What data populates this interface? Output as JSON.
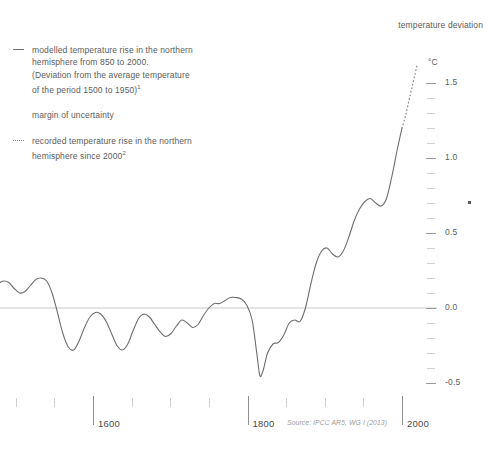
{
  "legend": {
    "entries": [
      {
        "marker": "solid-line",
        "text": "modelled temperature rise in the northern\nhemisphere from 850 to 2000.\n(Deviation from the average temperature\nof the period 1500 to 1950)",
        "footnote": "1",
        "footnote_after_line": 2
      },
      {
        "marker": "none",
        "text": "margin of uncertainty",
        "footnote": ""
      },
      {
        "marker": "dotted-line",
        "text": "recorded temperature rise in the northern\nhemisphere since 2000",
        "footnote": "2"
      }
    ]
  },
  "axis_title": "temperature\ndeviation",
  "unit": "°C",
  "source": "Source: IPCC AR5, WG I (2013)",
  "chart_data": {
    "type": "line",
    "title": "temperature deviation",
    "xlabel": "",
    "ylabel": "°C",
    "xlim": [
      1400,
      2025
    ],
    "ylim": [
      -0.62,
      1.72
    ],
    "grid": false,
    "legend_position": "top-left",
    "zero_line": 0.0,
    "y_major_ticks": [
      -0.5,
      0.0,
      0.5,
      1.0,
      1.5
    ],
    "y_major_tick_labels": [
      "-0.5",
      "0.0",
      "0.5",
      "1.0",
      "1.5"
    ],
    "y_minor_tick_step": 0.1,
    "x_major_ticks": [
      1600,
      1800,
      2000
    ],
    "x_major_tick_labels": [
      "1600",
      "1800",
      "2000"
    ],
    "x_minor_tick_step": 50,
    "series": [
      {
        "name": "modelled temperature rise in the northern hemisphere from 850 to 2000",
        "style": "solid",
        "color": "#6e6e6e",
        "x": [
          1400,
          1407,
          1414,
          1421,
          1428,
          1435,
          1442,
          1449,
          1456,
          1463,
          1470,
          1477,
          1484,
          1491,
          1498,
          1505,
          1512,
          1519,
          1526,
          1533,
          1540,
          1547,
          1554,
          1561,
          1568,
          1575,
          1582,
          1589,
          1596,
          1603,
          1610,
          1617,
          1624,
          1631,
          1638,
          1645,
          1652,
          1659,
          1666,
          1673,
          1680,
          1687,
          1694,
          1701,
          1708,
          1715,
          1722,
          1729,
          1736,
          1743,
          1750,
          1757,
          1764,
          1771,
          1778,
          1785,
          1792,
          1799,
          1806,
          1812,
          1816,
          1820,
          1826,
          1833,
          1840,
          1847,
          1854,
          1861,
          1868,
          1875,
          1882,
          1889,
          1896,
          1903,
          1910,
          1917,
          1924,
          1931,
          1938,
          1945,
          1952,
          1959,
          1966,
          1973,
          1980,
          1987,
          1994,
          2000
        ],
        "y": [
          0.06,
          0.05,
          0.04,
          0.07,
          0.12,
          0.16,
          0.17,
          0.14,
          0.1,
          0.09,
          0.12,
          0.16,
          0.18,
          0.17,
          0.13,
          0.1,
          0.11,
          0.15,
          0.19,
          0.2,
          0.18,
          0.1,
          -0.03,
          -0.17,
          -0.26,
          -0.28,
          -0.22,
          -0.13,
          -0.06,
          -0.03,
          -0.04,
          -0.09,
          -0.17,
          -0.25,
          -0.28,
          -0.24,
          -0.15,
          -0.07,
          -0.04,
          -0.06,
          -0.11,
          -0.16,
          -0.19,
          -0.17,
          -0.12,
          -0.08,
          -0.1,
          -0.13,
          -0.11,
          -0.05,
          0.0,
          0.03,
          0.03,
          0.05,
          0.07,
          0.07,
          0.06,
          0.02,
          -0.08,
          -0.3,
          -0.45,
          -0.42,
          -0.3,
          -0.24,
          -0.23,
          -0.18,
          -0.1,
          -0.08,
          -0.09,
          0.0,
          0.16,
          0.3,
          0.38,
          0.4,
          0.36,
          0.34,
          0.38,
          0.47,
          0.58,
          0.66,
          0.71,
          0.73,
          0.7,
          0.68,
          0.73,
          0.88,
          1.06,
          1.2
        ]
      },
      {
        "name": "recorded temperature rise in the northern hemisphere since 2000",
        "style": "dotted",
        "color": "#8a8a8a",
        "x": [
          2000,
          2004,
          2008,
          2012,
          2016,
          2020
        ],
        "y": [
          1.2,
          1.27,
          1.36,
          1.45,
          1.54,
          1.63
        ]
      }
    ]
  }
}
